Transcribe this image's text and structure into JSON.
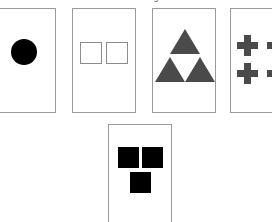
{
  "caption": {
    "text": "Visual Reasoning Task",
    "visible": "clipped"
  },
  "canvas": {
    "width": 272,
    "height": 222,
    "background": "#ffffff"
  },
  "palette": {
    "card_border": "#9a9a9a",
    "card_fill": "#ffffff",
    "solid_black": "#000000",
    "solid_gray": "#4a4a4a",
    "outline_gray": "#8c8c8c"
  },
  "cards": [
    {
      "id": "card-1",
      "label": "Card 1",
      "position": "top-row-1",
      "clipped": "left-edge",
      "shape_name": "circle",
      "shape_fill": "solid",
      "shape_color": "#000000",
      "shape_count": 1,
      "arrangement": "single-centered",
      "description": "One solid black circle"
    },
    {
      "id": "card-2",
      "label": "Card 2",
      "position": "top-row-2",
      "clipped": "none",
      "shape_name": "square",
      "shape_fill": "outline",
      "shape_color": "#8c8c8c",
      "shape_count": 2,
      "arrangement": "side-by-side",
      "description": "Two outlined squares side by side"
    },
    {
      "id": "card-3",
      "label": "Card 3",
      "position": "top-row-3",
      "clipped": "none",
      "shape_name": "triangle",
      "shape_fill": "solid",
      "shape_color": "#4a4a4a",
      "shape_count": 3,
      "arrangement": "pyramid",
      "description": "Three solid gray triangles in a pyramid"
    },
    {
      "id": "card-4",
      "label": "Card 4",
      "position": "top-row-4",
      "clipped": "right-edge",
      "shape_name": "cross",
      "shape_fill": "solid",
      "shape_color": "#4a4a4a",
      "shape_count": 4,
      "arrangement": "two-by-two-grid",
      "description": "Four solid gray crosses in a 2x2 grid"
    },
    {
      "id": "card-5",
      "label": "Card 5",
      "position": "bottom-row-centered",
      "clipped": "none",
      "shape_name": "square",
      "shape_fill": "solid",
      "shape_color": "#000000",
      "shape_count": 3,
      "arrangement": "two-top-one-below",
      "description": "Three solid black squares, two above and one centered below"
    }
  ]
}
